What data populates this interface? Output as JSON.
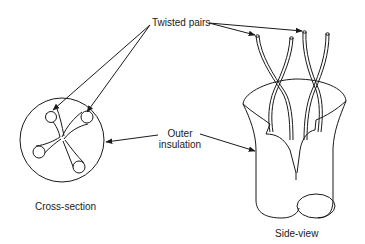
{
  "diagram": {
    "type": "illustration",
    "labels": {
      "twisted_pairs": "Twisted pairs",
      "outer_insulation_line1": "Outer",
      "outer_insulation_line2": "insulation",
      "cross_section": "Cross-section",
      "side_view": "Side-view"
    },
    "parts": [
      {
        "name": "cross-section-view",
        "caption": "Cross-section"
      },
      {
        "name": "side-view",
        "caption": "Side-view"
      }
    ],
    "colors": {
      "stroke": "#1a1a1a",
      "background": "#ffffff"
    }
  }
}
